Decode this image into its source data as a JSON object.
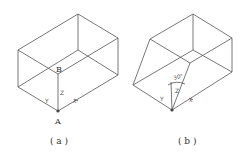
{
  "figure_a": {
    "caption": "( a )",
    "point_top": "B",
    "point_bottom": "A",
    "axis_y": "Y",
    "axis_z": "Z",
    "axis_x": "X"
  },
  "figure_b": {
    "caption": "( b )",
    "angle_label": "30°",
    "axis_y": "Y",
    "axis_z": "Z",
    "axis_x": "X"
  },
  "colors": {
    "line": "#555555",
    "text": "#333333",
    "background": "#ffffff"
  }
}
